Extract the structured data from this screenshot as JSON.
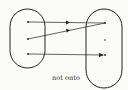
{
  "diagram": {
    "caption": "not onto",
    "colors": {
      "stroke": "#222222",
      "background": "#fbfbfa"
    },
    "domain_set": {
      "points": [
        {
          "id": "a1",
          "x": 28,
          "y": 22
        },
        {
          "id": "a2",
          "x": 28,
          "y": 39
        },
        {
          "id": "a3",
          "x": 28,
          "y": 54
        }
      ]
    },
    "codomain_set": {
      "points": [
        {
          "id": "b1",
          "x": 105,
          "y": 23
        },
        {
          "id": "b2",
          "x": 105,
          "y": 40
        },
        {
          "id": "b3",
          "x": 105,
          "y": 55
        }
      ]
    },
    "mappings": [
      {
        "from": "a1",
        "to": "b1"
      },
      {
        "from": "a2",
        "to": "b1"
      },
      {
        "from": "a3",
        "to": "b3"
      }
    ],
    "unmapped_codomain_points": [
      "b2"
    ]
  }
}
